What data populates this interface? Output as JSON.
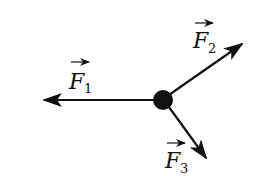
{
  "diagram": {
    "forces": [
      {
        "name": "F",
        "sub": "1",
        "direction": "left"
      },
      {
        "name": "F",
        "sub": "2",
        "direction": "up-right"
      },
      {
        "name": "F",
        "sub": "3",
        "direction": "down-right"
      }
    ],
    "colors": {
      "stroke": "#111111",
      "background": "#ffffff"
    }
  }
}
